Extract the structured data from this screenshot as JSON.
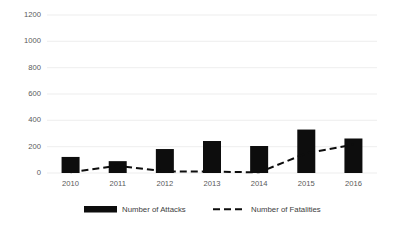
{
  "chart_data": {
    "type": "bar",
    "title": "",
    "xlabel": "",
    "ylabel": "",
    "categories": [
      "2010",
      "2011",
      "2012",
      "2013",
      "2014",
      "2015",
      "2016"
    ],
    "ylim": [
      0,
      1200
    ],
    "yticks": [
      0,
      200,
      400,
      600,
      800,
      1000,
      1200
    ],
    "ytick_labels": [
      "0",
      "200",
      "400",
      "600",
      "800",
      "1000",
      "1200"
    ],
    "grid": "horizontal",
    "legend_position": "bottom",
    "series": [
      {
        "name": "Number of Attacks",
        "type": "bar",
        "color": "#0d0d0d",
        "values": [
          122,
          90,
          182,
          243,
          205,
          330,
          262
        ]
      },
      {
        "name": "Number of Fatalities",
        "type": "line",
        "style": "dashed",
        "color": "#0d0d0d",
        "values": [
          5,
          55,
          12,
          10,
          5,
          150,
          215
        ]
      }
    ]
  },
  "legend": {
    "items": [
      {
        "label": "Number of Attacks",
        "marker": "filled-rect"
      },
      {
        "label": "Number of Fatalities",
        "marker": "dashed-line"
      }
    ]
  },
  "axis": {
    "y_labels": [
      "1200",
      "1000",
      "800",
      "600",
      "400",
      "200",
      "0"
    ],
    "x_labels": [
      "2010",
      "2011",
      "2012",
      "2013",
      "2014",
      "2015",
      "2016"
    ]
  }
}
